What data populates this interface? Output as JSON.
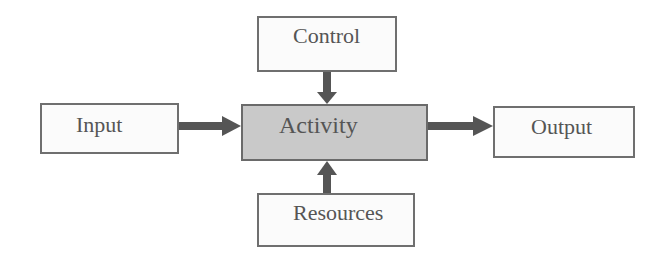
{
  "diagram": {
    "type": "process-block-diagram",
    "colors": {
      "arrow": "#555555",
      "box_border": "#6f6f6f",
      "box_fill": "#fbfbfb",
      "activity_fill": "#c9c9c9",
      "text": "#555555"
    },
    "nodes": {
      "control": {
        "label": "Control"
      },
      "input": {
        "label": "Input"
      },
      "activity": {
        "label": "Activity"
      },
      "output": {
        "label": "Output"
      },
      "resources": {
        "label": "Resources"
      }
    },
    "edges": [
      {
        "from": "input",
        "to": "activity"
      },
      {
        "from": "control",
        "to": "activity"
      },
      {
        "from": "resources",
        "to": "activity"
      },
      {
        "from": "activity",
        "to": "output"
      }
    ]
  }
}
